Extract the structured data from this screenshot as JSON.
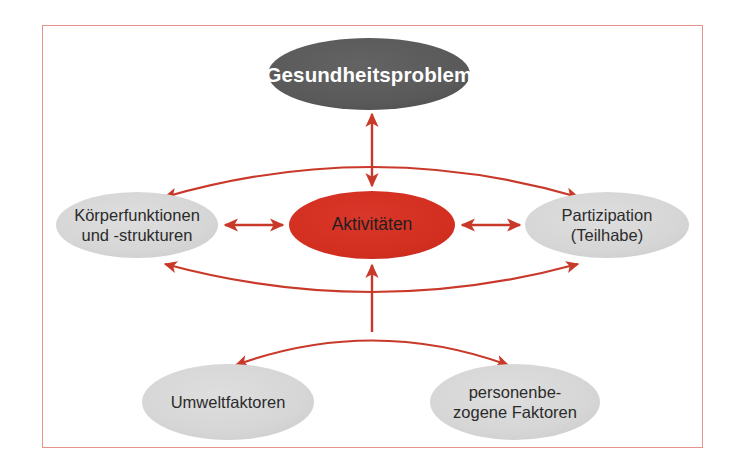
{
  "diagram": {
    "frame_color": "#e8928c",
    "background": "#ffffff",
    "nodes": [
      {
        "id": "health-problem",
        "label": "Gesundheitsproblem",
        "lines": [
          "Gesundheitsproblem"
        ],
        "fill": "#5a5a5a",
        "text_color": "#ffffff",
        "cx": 369,
        "cy": 74,
        "rx": 101,
        "ry": 36
      },
      {
        "id": "body-functions",
        "label": "Körperfunktionen und -strukturen",
        "lines": [
          "Körperfunktionen",
          "und -strukturen"
        ],
        "fill": "#d8d8d8",
        "text_color": "#2b2b2b",
        "cx": 137,
        "cy": 225,
        "rx": 81,
        "ry": 33
      },
      {
        "id": "activities",
        "label": "Aktivitäten",
        "lines": [
          "Aktivitäten"
        ],
        "fill": "#d32f20",
        "text_color": "#1f1f1f",
        "cx": 372,
        "cy": 225,
        "rx": 83,
        "ry": 34
      },
      {
        "id": "participation",
        "label": "Partizipation (Teilhabe)",
        "lines": [
          "Partizipation",
          "(Teilhabe)"
        ],
        "fill": "#d8d8d8",
        "text_color": "#2b2b2b",
        "cx": 607,
        "cy": 225,
        "rx": 82,
        "ry": 33
      },
      {
        "id": "environmental-factors",
        "label": "Umweltfaktoren",
        "lines": [
          "Umweltfaktoren"
        ],
        "fill": "#d8d8d8",
        "text_color": "#2b2b2b",
        "cx": 228,
        "cy": 402,
        "rx": 86,
        "ry": 38
      },
      {
        "id": "personal-factors",
        "label": "personenbezogene Faktoren",
        "lines": [
          "personenbe-",
          "zogene Faktoren"
        ],
        "fill": "#d8d8d8",
        "text_color": "#2b2b2b",
        "cx": 515,
        "cy": 402,
        "rx": 85,
        "ry": 38
      }
    ],
    "connectors": [
      {
        "id": "health-to-activities",
        "from": "health-problem",
        "to": "activities",
        "style": "straight-vertical",
        "heads": "both",
        "color": "#c9392a"
      },
      {
        "id": "body-to-participation-upper",
        "from": "body-functions",
        "to": "participation",
        "style": "arc-up",
        "heads": "both",
        "color": "#c9392a"
      },
      {
        "id": "body-to-activities",
        "from": "body-functions",
        "to": "activities",
        "style": "straight-horizontal",
        "heads": "both",
        "color": "#c9392a"
      },
      {
        "id": "activities-to-participation",
        "from": "activities",
        "to": "participation",
        "style": "straight-horizontal",
        "heads": "both",
        "color": "#c9392a"
      },
      {
        "id": "body-to-participation-lower",
        "from": "body-functions",
        "to": "participation",
        "style": "arc-down",
        "heads": "both",
        "color": "#c9392a"
      },
      {
        "id": "activities-to-context",
        "from": "activities",
        "to": "context-arc",
        "style": "straight-vertical",
        "heads": "up",
        "color": "#c9392a"
      },
      {
        "id": "environment-to-personal",
        "from": "environmental-factors",
        "to": "personal-factors",
        "style": "arc-down",
        "heads": "both",
        "color": "#c9392a"
      }
    ]
  }
}
